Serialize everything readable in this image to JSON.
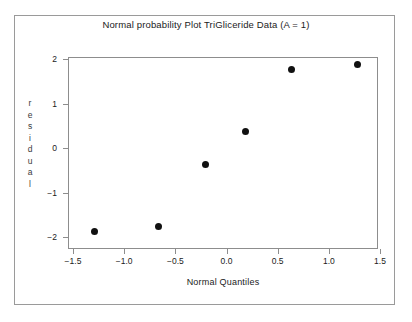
{
  "chart_data": {
    "type": "scatter",
    "title": "Normal probability Plot TriGliceride Data (A = 1)",
    "xlabel": "Normal Quantiles",
    "ylabel": "residual",
    "ylabel_letters": [
      "r",
      "e",
      "s",
      "i",
      "d",
      "u",
      "a",
      "l"
    ],
    "xlim": [
      -1.65,
      1.65
    ],
    "ylim": [
      -2.17,
      2.17
    ],
    "xticks": [
      -1.5,
      -1.0,
      -0.5,
      0.0,
      0.5,
      1.0,
      1.5
    ],
    "xticklabels": [
      "-1.5",
      "-1.0",
      "-0.5",
      "0.0",
      "0.5",
      "1.0",
      "1.5"
    ],
    "yticks": [
      2,
      1,
      0,
      -1,
      -2
    ],
    "yticklabels": [
      "2",
      "1",
      "0",
      "-1",
      "-2"
    ],
    "grid": false,
    "legend": false,
    "marker": "filled-circle",
    "marker_color": "#111111",
    "frame_color": "#8d8d8d",
    "x": [
      -1.29,
      -0.66,
      -0.21,
      0.19,
      0.64,
      1.28
    ],
    "y": [
      -1.87,
      -1.77,
      -0.36,
      0.36,
      1.76,
      1.87
    ],
    "points": [
      {
        "x": -1.29,
        "y": -1.87
      },
      {
        "x": -0.66,
        "y": -1.77
      },
      {
        "x": -0.21,
        "y": -0.36
      },
      {
        "x": 0.19,
        "y": 0.36
      },
      {
        "x": 0.64,
        "y": 1.76
      },
      {
        "x": 1.28,
        "y": 1.87
      }
    ]
  }
}
